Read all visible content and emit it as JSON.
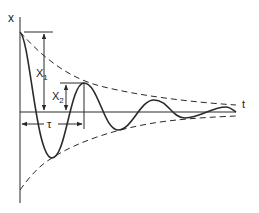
{
  "diagram": {
    "axes": {
      "y_label": "x",
      "x_label": "t"
    },
    "annotations": {
      "amplitude_1": {
        "label": "X",
        "subscript": "1"
      },
      "amplitude_2": {
        "label": "X",
        "subscript": "2"
      },
      "period": {
        "label": "τ"
      }
    },
    "colors": {
      "stroke": "#2a2a2a",
      "background": "#ffffff"
    }
  }
}
